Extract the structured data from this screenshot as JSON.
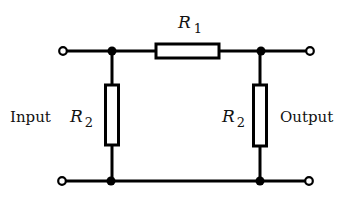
{
  "diagram": {
    "type": "circuit",
    "labels": {
      "input": "Input",
      "output": "Output",
      "series_resistor": {
        "symbol": "R",
        "subscript": "1"
      },
      "left_shunt_resistor": {
        "symbol": "R",
        "subscript": "2"
      },
      "right_shunt_resistor": {
        "symbol": "R",
        "subscript": "2"
      }
    },
    "components": [
      {
        "id": "R1",
        "kind": "resistor",
        "orientation": "horizontal",
        "position": "top series"
      },
      {
        "id": "R2-left",
        "kind": "resistor",
        "orientation": "vertical",
        "position": "input shunt"
      },
      {
        "id": "R2-right",
        "kind": "resistor",
        "orientation": "vertical",
        "position": "output shunt"
      }
    ],
    "terminals": [
      "input-top",
      "input-bottom",
      "output-top",
      "output-bottom"
    ],
    "junctions": 4,
    "colors": {
      "line": "#000000",
      "background": "#ffffff"
    }
  }
}
